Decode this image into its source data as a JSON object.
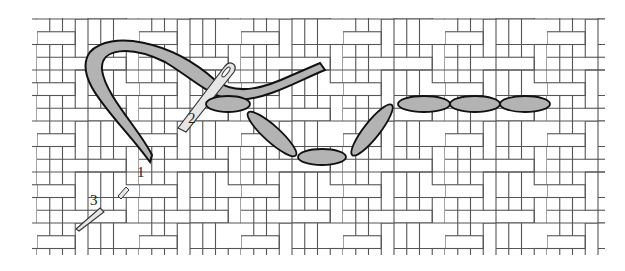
{
  "diagram": {
    "type": "embroidery-stitch-illustration",
    "labels": [
      {
        "id": "step-1",
        "text": "1"
      },
      {
        "id": "step-2",
        "text": "2"
      },
      {
        "id": "step-3",
        "text": "3"
      }
    ],
    "colors": {
      "background": "#ffffff",
      "fabric_line": "#555555",
      "thread_fill": "#b3b3b3",
      "thread_outline": "#111111",
      "needle_fill": "#e6e6e6"
    },
    "stitch_count": 7
  }
}
